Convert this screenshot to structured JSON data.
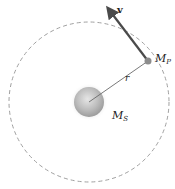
{
  "diagram": {
    "type": "circular-orbit",
    "orbit": {
      "cx": 89,
      "cy": 102,
      "r": 80,
      "stroke": "#9a9a9a",
      "style": "dashed"
    },
    "sun": {
      "label_main": "M",
      "label_sub": "S",
      "cx": 89,
      "cy": 102,
      "r": 15,
      "color": "#b5b5b5"
    },
    "planet": {
      "label_main": "M",
      "label_sub": "P",
      "cx": 148,
      "cy": 61,
      "r": 3.5,
      "color": "#8c8c8c"
    },
    "radius_vector": {
      "label": "r",
      "color": "#666666"
    },
    "velocity_vector": {
      "label": "v",
      "tip_x": 107,
      "tip_y": 7,
      "color": "#4a4a4a"
    }
  }
}
